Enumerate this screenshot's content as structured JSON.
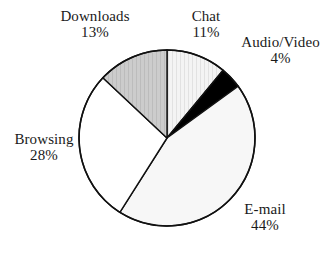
{
  "chart_data": {
    "type": "pie",
    "title": "",
    "categories": [
      "Chat",
      "Audio/Video",
      "E-mail",
      "Browsing",
      "Downloads"
    ],
    "values": [
      11,
      4,
      44,
      28,
      13
    ],
    "unit": "%",
    "start_angle_deg": 0,
    "direction": "clockwise",
    "legend": "none",
    "labels_position": "outside",
    "slices": [
      {
        "name": "Chat",
        "value": 11,
        "label": "Chat",
        "percent_label": "11%",
        "fill": "#f2f2f2",
        "pattern": "vertical-stripes",
        "stroke": "#111111"
      },
      {
        "name": "Audio/Video",
        "value": 4,
        "label": "Audio/Video",
        "percent_label": "4%",
        "fill": "#000000",
        "pattern": "solid",
        "stroke": "#111111"
      },
      {
        "name": "E-mail",
        "value": 44,
        "label": "E-mail",
        "percent_label": "44%",
        "fill": "#f7f7f7",
        "pattern": "solid",
        "stroke": "#111111"
      },
      {
        "name": "Browsing",
        "value": 28,
        "label": "Browsing",
        "percent_label": "28%",
        "fill": "#ffffff",
        "pattern": "solid",
        "stroke": "#111111"
      },
      {
        "name": "Downloads",
        "value": 13,
        "label": "Downloads",
        "percent_label": "13%",
        "fill": "#c9c9c9",
        "pattern": "vertical-hatch",
        "stroke": "#111111"
      }
    ],
    "geometry": {
      "center_x": 167,
      "center_y": 138,
      "radius": 88
    },
    "colors": {
      "background": "#ffffff",
      "outline": "#111111",
      "text": "#1a1a1a"
    }
  }
}
